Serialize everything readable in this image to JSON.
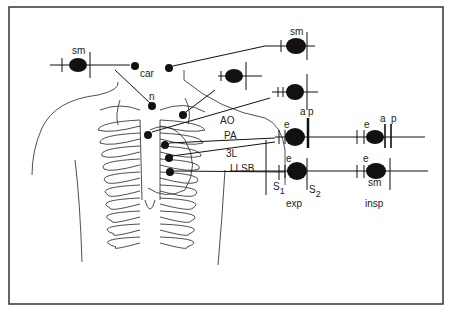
{
  "figure": {
    "type": "auscultation-sites-phonocardiogram",
    "sites": [
      {
        "id": "car-left",
        "label": "car"
      },
      {
        "id": "car-right",
        "label": ""
      },
      {
        "id": "n",
        "label": "n"
      },
      {
        "id": "AO",
        "label": "AO"
      },
      {
        "id": "PA",
        "label": "PA"
      },
      {
        "id": "3L",
        "label": "3L"
      },
      {
        "id": "LLSB",
        "label": "LLSB"
      }
    ],
    "traces": {
      "left_carotid": {
        "murmur_label": "sm"
      },
      "right_carotid": {
        "murmur_label": "sm"
      },
      "pa_exp": {
        "ejection_label": "e",
        "a_label": "a",
        "p_label": "p"
      },
      "pa_insp": {
        "ejection_label": "e",
        "a_label": "a",
        "p_label": "p"
      },
      "llsb_exp": {
        "ejection_label": "e",
        "s1_label": "S",
        "s1_sub": "1",
        "s2_label": "S",
        "s2_sub": "2"
      },
      "llsb_insp": {
        "ejection_label": "e",
        "murmur_label": "sm"
      }
    },
    "phase_labels": {
      "expiration": "exp",
      "inspiration": "insp"
    }
  },
  "colors": {
    "ink": "#111111",
    "background": "#ffffff",
    "frame": "#333333"
  }
}
